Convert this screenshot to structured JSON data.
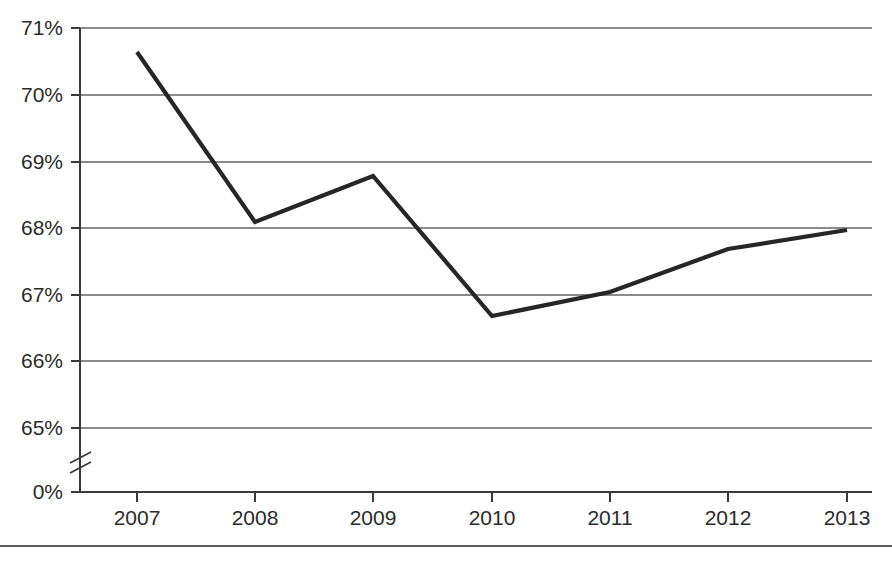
{
  "chart_data": {
    "type": "line",
    "title": "",
    "subtitle": "",
    "xlabel": "",
    "ylabel": "",
    "categories": [
      "2007",
      "2008",
      "2009",
      "2010",
      "2011",
      "2012",
      "2013"
    ],
    "values": [
      70.65,
      68.1,
      68.8,
      66.7,
      67.05,
      67.7,
      67.98
    ],
    "series": [
      {
        "name": "rate",
        "values": [
          70.65,
          68.1,
          68.8,
          66.7,
          67.05,
          67.7,
          67.98
        ],
        "color": "#262626"
      }
    ],
    "x": [
      "2007",
      "2008",
      "2009",
      "2010",
      "2011",
      "2012",
      "2013"
    ],
    "ylim": [
      65,
      71
    ],
    "ytick_values": [
      71,
      70,
      69,
      68,
      67,
      66,
      65,
      0
    ],
    "ytick_labels": [
      "71%",
      "70%",
      "69%",
      "68%",
      "67%",
      "66%",
      "65%",
      "0%"
    ],
    "xtick_labels": [
      "2007",
      "2008",
      "2009",
      "2010",
      "2011",
      "2012",
      "2013"
    ],
    "grid": true,
    "grid_axis": "y",
    "legend": false,
    "legend_position": "none",
    "axis_break": {
      "present": true,
      "between": [
        65,
        0
      ],
      "symbol": "double-slash"
    },
    "annotations": [],
    "colors": {
      "line": "#262626",
      "grid": "#8a8a8a",
      "axis": "#3a3a3a",
      "label": "#2b2b2b",
      "background": "#ffffff"
    }
  },
  "axes": {
    "y_ticks": [
      {
        "label": "71%",
        "value": 71,
        "y": 28
      },
      {
        "label": "70%",
        "value": 70,
        "y": 95
      },
      {
        "label": "69%",
        "value": 69,
        "y": 162
      },
      {
        "label": "68%",
        "value": 68,
        "y": 228
      },
      {
        "label": "67%",
        "value": 67,
        "y": 295
      },
      {
        "label": "66%",
        "value": 66,
        "y": 361
      },
      {
        "label": "65%",
        "value": 65,
        "y": 428
      },
      {
        "label": "0%",
        "value": 0,
        "y": 492
      }
    ],
    "x_ticks": [
      {
        "label": "2007",
        "x": 137
      },
      {
        "label": "2008",
        "x": 255
      },
      {
        "label": "2009",
        "x": 373
      },
      {
        "label": "2010",
        "x": 492
      },
      {
        "label": "2011",
        "x": 610
      },
      {
        "label": "2012",
        "x": 728
      },
      {
        "label": "2013",
        "x": 847
      }
    ]
  },
  "points": [
    {
      "label": "2007",
      "value": 70.65,
      "x": 137,
      "y": 52
    },
    {
      "label": "2008",
      "value": 68.1,
      "x": 255,
      "y": 222
    },
    {
      "label": "2009",
      "value": 68.8,
      "x": 373,
      "y": 176
    },
    {
      "label": "2010",
      "value": 66.7,
      "x": 492,
      "y": 316
    },
    {
      "label": "2011",
      "value": 67.05,
      "x": 610,
      "y": 292
    },
    {
      "label": "2012",
      "value": 67.7,
      "x": 728,
      "y": 249
    },
    {
      "label": "2013",
      "value": 67.98,
      "x": 847,
      "y": 230
    }
  ]
}
